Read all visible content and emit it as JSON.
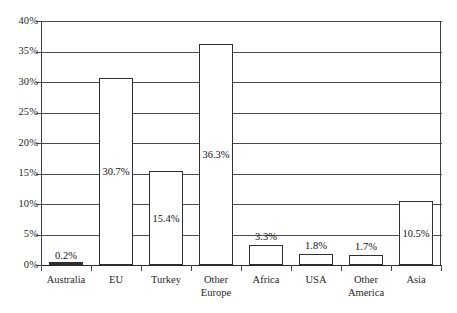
{
  "chart_data": {
    "type": "bar",
    "title": "",
    "xlabel": "",
    "ylabel": "",
    "categories": [
      "Australia",
      "EU",
      "Turkey",
      "Other Europe",
      "Africa",
      "USA",
      "Other America",
      "Asia"
    ],
    "values": [
      0.2,
      30.7,
      15.4,
      36.3,
      3.3,
      1.8,
      1.7,
      10.5
    ],
    "data_labels": [
      "0.2%",
      "30.7%",
      "15.4%",
      "36.3%",
      "3.3%",
      "1.8%",
      "1.7%",
      "10.5%"
    ],
    "ylim": [
      0,
      40
    ],
    "ytick_values": [
      0,
      5,
      10,
      15,
      20,
      25,
      30,
      35,
      40
    ],
    "ytick_labels": [
      "0%",
      "5%",
      "10%",
      "15%",
      "20%",
      "25%",
      "30%",
      "35%",
      "40%"
    ],
    "grid": true,
    "legend": "none",
    "bar_fill_color": "#ffffff",
    "bar_border_color": "#2f2f2f",
    "grid_color": "#4a4a4a",
    "background_color": "#ffffff"
  }
}
